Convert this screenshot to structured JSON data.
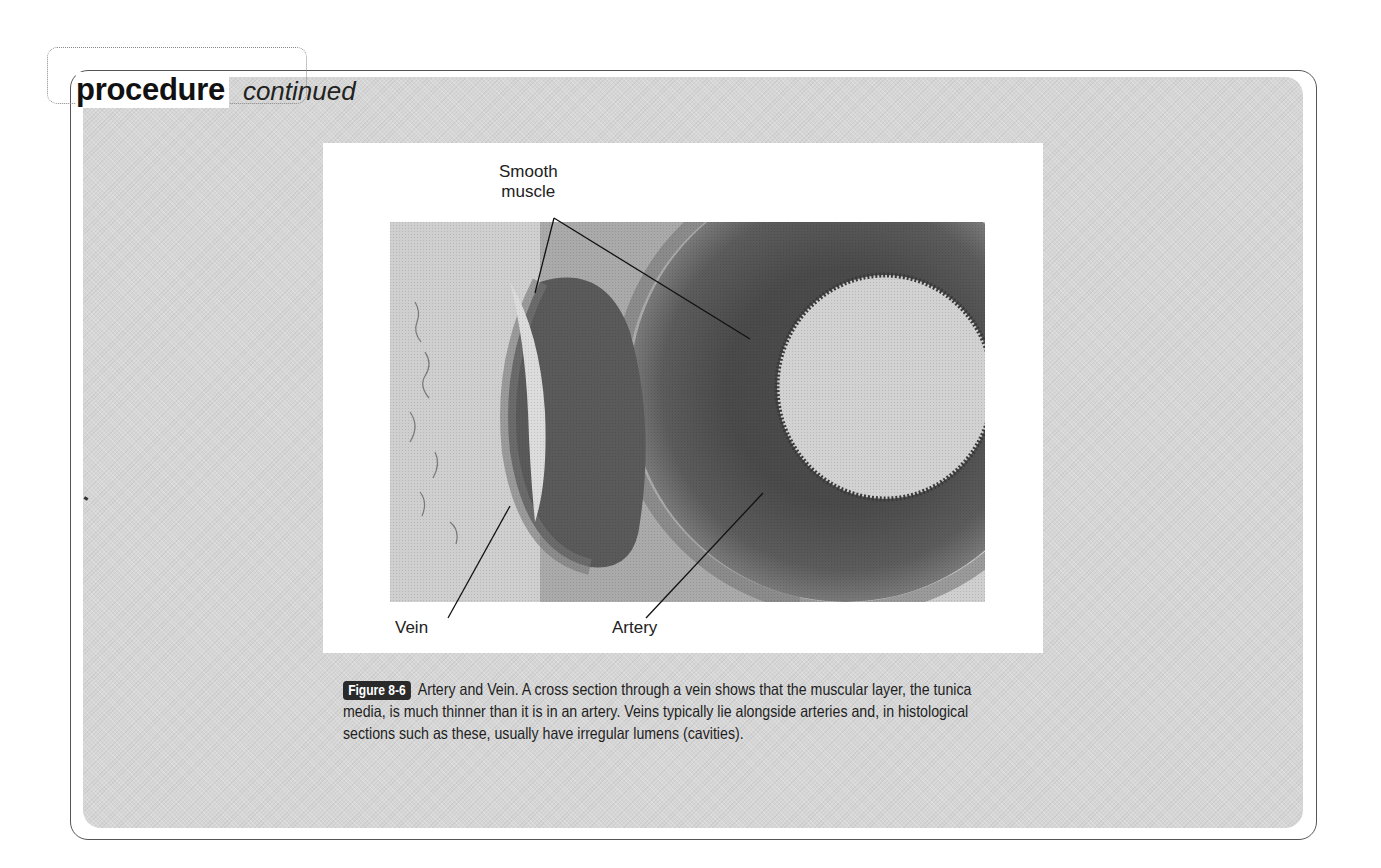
{
  "header": {
    "title": "procedure",
    "subtitle": "continued"
  },
  "figure": {
    "labels": {
      "smooth_muscle_line1": "Smooth",
      "smooth_muscle_line2": "muscle",
      "vein": "Vein",
      "artery": "Artery"
    },
    "image_description": "Histological cross section micrograph showing a vein (left, slit-like irregular lumen) and an artery (right, thick muscular wall with round lumen)",
    "caption": {
      "badge": "Figure 8-6",
      "text": "Artery and Vein. A cross section through a vein shows that the muscular layer, the tunica media, is much thinner than it is in an artery. Veins typically lie alongside arteries and, in histological sections such as these, usually have irregular lumens (cavities)."
    }
  },
  "colors": {
    "panel_gray": "#d6d6d6",
    "frame": "#555555",
    "badge_bg": "#2a2a2a",
    "text": "#1a1a1a"
  }
}
